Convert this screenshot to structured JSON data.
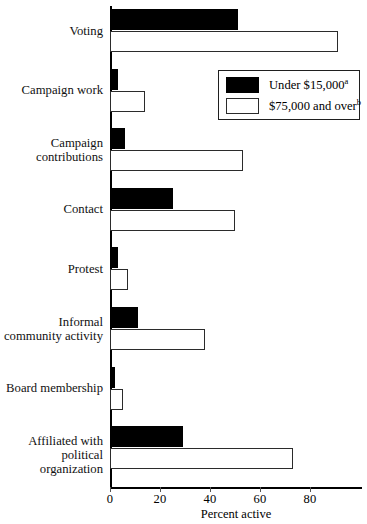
{
  "chart_data": {
    "type": "bar",
    "orientation": "horizontal",
    "title": "",
    "xlabel": "Percent active",
    "ylabel": "",
    "xlim": [
      0,
      100
    ],
    "xticks": [
      0,
      20,
      40,
      60,
      80
    ],
    "xtick_labels": [
      "0",
      "20",
      "40",
      "60",
      "80"
    ],
    "grid": false,
    "legend_position": "upper right",
    "categories": [
      "Voting",
      "Campaign work",
      "Campaign contributions",
      "Contact",
      "Protest",
      "Informal community activity",
      "Board membership",
      "Affiliated with political organization"
    ],
    "category_lines": [
      [
        "Voting"
      ],
      [
        "Campaign work"
      ],
      [
        "Campaign",
        "contributions"
      ],
      [
        "Contact"
      ],
      [
        "Protest"
      ],
      [
        "Informal",
        "community activity"
      ],
      [
        "Board membership"
      ],
      [
        "Affiliated with",
        "political organization"
      ]
    ],
    "series": [
      {
        "name": "Under $15,000",
        "footnote": "a",
        "color": "#000000",
        "style": "filled",
        "values": [
          51,
          3,
          6,
          25,
          3,
          11,
          2,
          29
        ]
      },
      {
        "name": "$75,000 and over",
        "footnote": "b",
        "color": "#ffffff",
        "style": "outlined",
        "values": [
          91,
          14,
          53,
          50,
          7,
          38,
          5,
          73
        ]
      }
    ]
  },
  "legend": {
    "entries": [
      {
        "label": "Under $15,000",
        "footnote": "a"
      },
      {
        "label": "$75,000 and over",
        "footnote": "b"
      }
    ]
  },
  "axis": {
    "x_title": "Percent active"
  }
}
